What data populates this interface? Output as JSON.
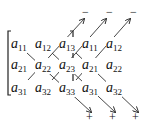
{
  "diagram": {
    "matrix": [
      [
        {
          "base": "a",
          "sub": "11"
        },
        {
          "base": "a",
          "sub": "12"
        },
        {
          "base": "a",
          "sub": "13"
        }
      ],
      [
        {
          "base": "a",
          "sub": "21"
        },
        {
          "base": "a",
          "sub": "22"
        },
        {
          "base": "a",
          "sub": "23"
        }
      ],
      [
        {
          "base": "a",
          "sub": "31"
        },
        {
          "base": "a",
          "sub": "32"
        },
        {
          "base": "a",
          "sub": "33"
        }
      ]
    ],
    "extension": [
      [
        {
          "base": "a",
          "sub": "11"
        },
        {
          "base": "a",
          "sub": "12"
        }
      ],
      [
        {
          "base": "a",
          "sub": "21"
        },
        {
          "base": "a",
          "sub": "22"
        }
      ],
      [
        {
          "base": "a",
          "sub": "31"
        },
        {
          "base": "a",
          "sub": "32"
        }
      ]
    ],
    "minus_signs": [
      "−",
      "−",
      "−"
    ],
    "plus_signs": [
      "+",
      "+",
      "+"
    ],
    "line_color": "#333333"
  }
}
